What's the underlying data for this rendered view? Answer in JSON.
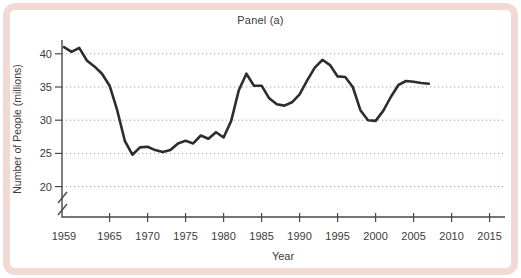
{
  "panel": {
    "title": "Panel (a)"
  },
  "chart_data": {
    "type": "line",
    "title": "Panel (a)",
    "xlabel": "Year",
    "ylabel": "Number of People (millions)",
    "x_tick_labels": [
      "1959",
      "1965",
      "1970",
      "1975",
      "1980",
      "1985",
      "1990",
      "1995",
      "2000",
      "2005",
      "2010",
      "2015"
    ],
    "y_tick_labels": [
      "20",
      "25",
      "30",
      "35",
      "40"
    ],
    "y_tick_values": [
      20,
      25,
      30,
      35,
      40
    ],
    "x_tick_values": [
      1959,
      1965,
      1970,
      1975,
      1980,
      1985,
      1990,
      1995,
      2000,
      2005,
      2010,
      2015
    ],
    "xlim": [
      1959,
      2017
    ],
    "ylim": [
      20,
      41.5
    ],
    "y_axis_break": true,
    "grid": "dotted-horizontal",
    "legend": "none",
    "x": [
      1959,
      1960,
      1961,
      1962,
      1963,
      1964,
      1965,
      1966,
      1967,
      1968,
      1969,
      1970,
      1971,
      1972,
      1973,
      1974,
      1975,
      1976,
      1977,
      1978,
      1979,
      1980,
      1981,
      1982,
      1983,
      1984,
      1985,
      1986,
      1987,
      1988,
      1989,
      1990,
      1991,
      1992,
      1993,
      1994,
      1995,
      1996,
      1997,
      1998,
      1999,
      2000,
      2001,
      2002,
      2003,
      2004,
      2005,
      2006,
      2007
    ],
    "values": [
      41.0,
      40.3,
      40.9,
      39.0,
      38.1,
      37.0,
      35.2,
      31.5,
      26.9,
      24.8,
      25.9,
      26.0,
      25.5,
      25.2,
      25.5,
      26.5,
      26.9,
      26.5,
      27.7,
      27.2,
      28.2,
      27.4,
      29.9,
      34.5,
      37.0,
      35.2,
      35.2,
      33.3,
      32.4,
      32.2,
      32.7,
      33.9,
      36.0,
      37.9,
      39.1,
      38.3,
      36.6,
      36.5,
      35.0,
      31.5,
      30.0,
      29.9,
      31.4,
      33.5,
      35.3,
      35.9,
      35.8,
      35.6,
      35.5
    ]
  },
  "colors": {
    "frame": "#f1dad3",
    "background": "#ffffff",
    "line": "#2d2d2d",
    "axis": "#4a4a4a",
    "grid": "#9a9a9a",
    "text": "#3b3b3b"
  }
}
